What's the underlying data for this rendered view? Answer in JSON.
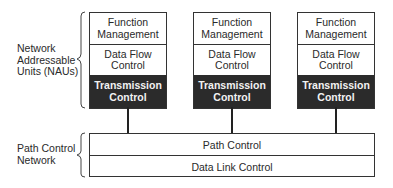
{
  "diagram": {
    "type": "layered-architecture",
    "groups": {
      "nau": {
        "label_lines": [
          "Network",
          "Addressable",
          "Units (NAUs)"
        ]
      },
      "pcn": {
        "label_lines": [
          "Path Control",
          "Network"
        ]
      }
    },
    "nau_columns": [
      {
        "function_management": [
          "Function",
          "Management"
        ],
        "data_flow_control": [
          "Data Flow",
          "Control"
        ],
        "transmission_control": [
          "Transmission",
          "Control"
        ]
      },
      {
        "function_management": [
          "Function",
          "Management"
        ],
        "data_flow_control": [
          "Data Flow",
          "Control"
        ],
        "transmission_control": [
          "Transmission",
          "Control"
        ]
      },
      {
        "function_management": [
          "Function",
          "Management"
        ],
        "data_flow_control": [
          "Data Flow",
          "Control"
        ],
        "transmission_control": [
          "Transmission",
          "Control"
        ]
      }
    ],
    "path_control_network": {
      "layers": [
        "Path Control",
        "Data Link Control"
      ]
    },
    "colors": {
      "line": "#333333",
      "transmission_fill": "#2b2b2b",
      "transmission_text": "#f2f2f2",
      "background": "#ffffff"
    }
  }
}
